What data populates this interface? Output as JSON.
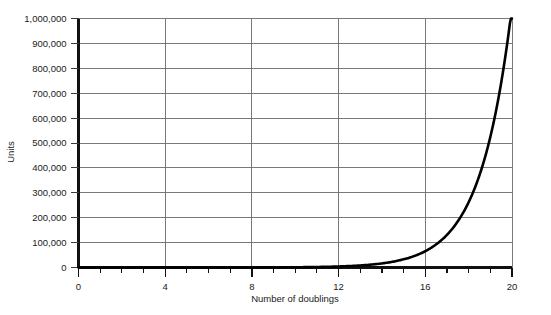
{
  "chart_data": {
    "type": "line",
    "title": "",
    "subtitle": "",
    "xlabel": "Number of doublings",
    "ylabel": "Units",
    "xlim": [
      0,
      20
    ],
    "ylim": [
      0,
      1000000
    ],
    "grid": true,
    "legend": null,
    "legend_position": "none",
    "x_major_ticks": [
      0,
      4,
      8,
      12,
      16,
      20
    ],
    "x_minor_tick_interval": 1,
    "x_tick_labels": [
      "0",
      "4",
      "8",
      "12",
      "16",
      "20"
    ],
    "y_ticks": [
      0,
      100000,
      200000,
      300000,
      400000,
      500000,
      600000,
      700000,
      800000,
      900000,
      1000000
    ],
    "y_tick_labels": [
      "0",
      "100,000",
      "200,000",
      "300,000",
      "400,000",
      "500,000",
      "600,000",
      "700,000",
      "800,000",
      "900,000",
      "1,000,000"
    ],
    "series": [
      {
        "name": "Units after n doublings",
        "formula": "y = 2^x",
        "x": [
          0,
          1,
          2,
          3,
          4,
          5,
          6,
          7,
          8,
          9,
          10,
          11,
          12,
          13,
          14,
          15,
          16,
          17,
          18,
          19,
          20
        ],
        "values": [
          1,
          2,
          4,
          8,
          16,
          32,
          64,
          128,
          256,
          512,
          1024,
          2048,
          4096,
          8192,
          16384,
          32768,
          65536,
          131072,
          262144,
          524288,
          1048576
        ]
      }
    ],
    "annotations": [],
    "colors": {
      "curve": "#000000",
      "gridline": "#6b6b6b",
      "axis": "#111111",
      "text": "#1a1a1a",
      "background": "#ffffff"
    }
  }
}
